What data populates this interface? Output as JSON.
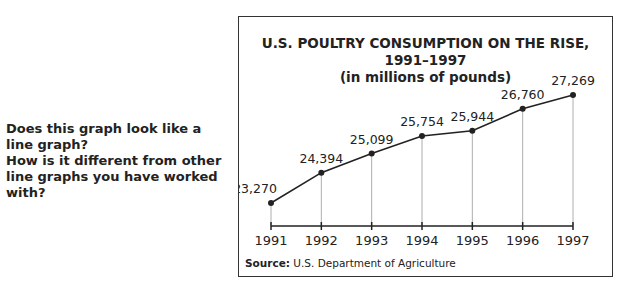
{
  "question": {
    "lines": [
      "Does this graph look like a",
      "line graph?",
      "How is it different from other",
      "line graphs you have worked",
      "with?"
    ]
  },
  "chart": {
    "title": "U.S. POULTRY CONSUMPTION ON THE RISE, 1991–1997",
    "subtitle": "(in millions of pounds)",
    "source_label": "Source:",
    "source_text": "U.S. Department of Agriculture"
  },
  "chart_data": {
    "type": "line",
    "title": "U.S. POULTRY CONSUMPTION ON THE RISE, 1991–1997",
    "subtitle": "(in millions of pounds)",
    "xlabel": "",
    "ylabel": "",
    "categories": [
      "1991",
      "1992",
      "1993",
      "1994",
      "1995",
      "1996",
      "1997"
    ],
    "values": [
      23270,
      24394,
      25099,
      25754,
      25944,
      26760,
      27269
    ],
    "data_labels": [
      "23,270",
      "24,394",
      "25,099",
      "25,754",
      "25,944",
      "26,760",
      "27,269"
    ],
    "grid": "vertical drop lines from each point to x-axis",
    "legend": "none",
    "source": "U.S. Department of Agriculture"
  }
}
